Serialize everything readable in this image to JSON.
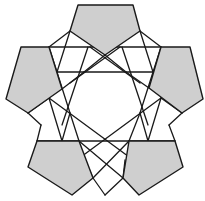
{
  "figure": {
    "colors": {
      "shade": "#cfcfcf",
      "line": "#1a1a1a",
      "background": "#ffffff"
    },
    "pentagons": [
      {
        "name": "top",
        "points": "78,5 133,5 140,31 105,55 70,31"
      },
      {
        "name": "left",
        "points": "21,47 49,47 62,89 28,113 6,99"
      },
      {
        "name": "right",
        "points": "161,47 190,47 203,99 182,113 149,88"
      },
      {
        "name": "bottom-left",
        "points": "37,141 79,141 93,178 72,195 28,167"
      },
      {
        "name": "bottom-right",
        "points": "129,141 175,141 183,167 139,195 123,178"
      }
    ]
  }
}
